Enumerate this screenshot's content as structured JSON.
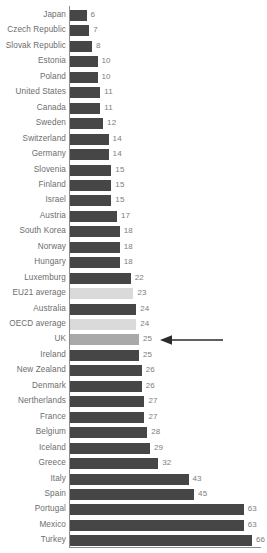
{
  "chart_data": {
    "type": "bar",
    "orientation": "horizontal",
    "title": "",
    "subtitle": "",
    "xlabel": "",
    "ylabel": "",
    "xlim": [
      0,
      66
    ],
    "grid": false,
    "legend": null,
    "categories": [
      "Japan",
      "Czech Republic",
      "Slovak Republic",
      "Estonia",
      "Poland",
      "United States",
      "Canada",
      "Sweden",
      "Switzerland",
      "Germany",
      "Slovenia",
      "Finland",
      "Israel",
      "Austria",
      "South Korea",
      "Norway",
      "Hungary",
      "Luxemburg",
      "EU21 average",
      "Australia",
      "OECD average",
      "UK",
      "Ireland",
      "New Zealand",
      "Denmark",
      "Nertherlands",
      "France",
      "Belgium",
      "Iceland",
      "Greece",
      "Italy",
      "Spain",
      "Portugal",
      "Mexico",
      "Turkey"
    ],
    "values": [
      6,
      7,
      8,
      10,
      10,
      11,
      11,
      12,
      14,
      14,
      15,
      15,
      15,
      17,
      18,
      18,
      18,
      22,
      23,
      24,
      24,
      25,
      25,
      26,
      26,
      27,
      27,
      28,
      29,
      32,
      43,
      45,
      63,
      63,
      66
    ],
    "value_labels": [
      "6",
      "7",
      "8",
      "10",
      "10",
      "11",
      "11",
      "12",
      "14",
      "14",
      "15",
      "15",
      "15",
      "17",
      "18",
      "18",
      "18",
      "22",
      "23",
      "24",
      "24",
      "25",
      "25",
      "26",
      "26",
      "27",
      "27",
      "28",
      "29",
      "32",
      "43",
      "45",
      "63",
      "63",
      "66"
    ],
    "bar_kinds": [
      "country",
      "country",
      "country",
      "country",
      "country",
      "country",
      "country",
      "country",
      "country",
      "country",
      "country",
      "country",
      "country",
      "country",
      "country",
      "country",
      "country",
      "country",
      "average",
      "country",
      "average",
      "highlight",
      "country",
      "country",
      "country",
      "country",
      "country",
      "country",
      "country",
      "country",
      "country",
      "country",
      "country",
      "country",
      "country"
    ],
    "annotations": [
      {
        "name": "uk-callout-arrow",
        "target_category": "UK",
        "direction": "left"
      }
    ],
    "colors": {
      "country_bar": "#464646",
      "average_bar": "#dadada",
      "highlight_bar": "#a9a9a9",
      "axis_line": "#8c8c8c",
      "category_label": "#6d6d6d",
      "value_label": "#7d7d7d",
      "annotation_arrow": "#2b2b2b",
      "background": "#ffffff"
    }
  }
}
